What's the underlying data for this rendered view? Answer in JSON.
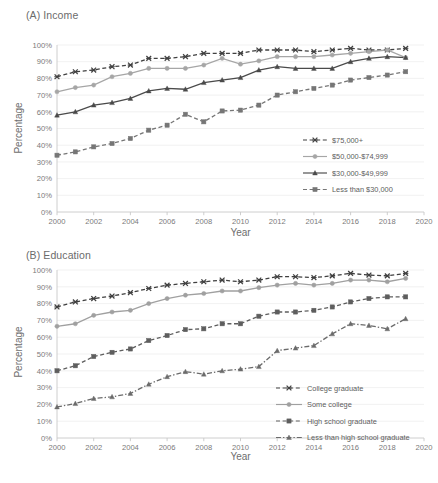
{
  "figure": {
    "panel_a_title": "(A) Income",
    "panel_b_title": "(B) Education",
    "xlabel": "Year",
    "ylabel": "Percentage"
  },
  "axis": {
    "y_ticks": [
      "0%",
      "10%",
      "20%",
      "30%",
      "40%",
      "50%",
      "60%",
      "70%",
      "80%",
      "90%",
      "100%"
    ],
    "x_ticks": [
      "2000",
      "2002",
      "2004",
      "2006",
      "2008",
      "2010",
      "2012",
      "2014",
      "2016",
      "2018",
      "2020"
    ]
  },
  "chart_data": [
    {
      "type": "line",
      "title": "(A) Income",
      "xlabel": "Year",
      "ylabel": "Percentage",
      "grid": true,
      "legend_position": "inside-right-middle",
      "xlim": [
        2000,
        2020
      ],
      "ylim": [
        0,
        100
      ],
      "x": [
        2000,
        2001,
        2002,
        2003,
        2004,
        2005,
        2006,
        2007,
        2008,
        2009,
        2010,
        2011,
        2012,
        2013,
        2014,
        2015,
        2016,
        2017,
        2018,
        2019
      ],
      "series": [
        {
          "name": "$75,000+",
          "marker": "x-marker",
          "linestyle": "dashed",
          "color": "#404040",
          "values": [
            81,
            84,
            85,
            87,
            88,
            92,
            92,
            93,
            95,
            95,
            95,
            97,
            97,
            97,
            96,
            97,
            98,
            97,
            97,
            98
          ]
        },
        {
          "name": "$50,000-$74,999",
          "marker": "circle-marker",
          "linestyle": "solid",
          "color": "#a6a6a6",
          "values": [
            72,
            74.5,
            76,
            81,
            83,
            86,
            86,
            86,
            88,
            92,
            88.5,
            90.5,
            93,
            93,
            93,
            94,
            95,
            96,
            97,
            92.5
          ]
        },
        {
          "name": "$30,000-$49,999",
          "marker": "triangle-marker",
          "linestyle": "solid",
          "color": "#4a4a4a",
          "values": [
            58,
            60,
            64,
            65.5,
            68,
            72.5,
            74,
            73.5,
            77.5,
            79,
            80.5,
            85,
            87,
            86,
            86,
            86,
            90,
            92,
            93,
            92.5
          ]
        },
        {
          "name": "Less than $30,000",
          "marker": "square-marker",
          "linestyle": "dashed",
          "color": "#767676",
          "values": [
            34,
            36,
            39,
            41,
            44,
            49,
            52,
            58.5,
            54,
            60.5,
            61,
            64,
            70,
            72,
            74,
            76,
            79,
            80.5,
            82,
            84
          ]
        }
      ]
    },
    {
      "type": "line",
      "title": "(B) Education",
      "xlabel": "Year",
      "ylabel": "Percentage",
      "grid": true,
      "legend_position": "inside-right-lower",
      "xlim": [
        2000,
        2020
      ],
      "ylim": [
        0,
        100
      ],
      "x": [
        2000,
        2001,
        2002,
        2003,
        2004,
        2005,
        2006,
        2007,
        2008,
        2009,
        2010,
        2011,
        2012,
        2013,
        2014,
        2015,
        2016,
        2017,
        2018,
        2019
      ],
      "series": [
        {
          "name": "College graduate",
          "marker": "x-marker",
          "linestyle": "dashed",
          "color": "#3f3f3f",
          "values": [
            78,
            81,
            83,
            84.5,
            86.5,
            89,
            91,
            92,
            93,
            94,
            93,
            94,
            96,
            96,
            95.5,
            96.5,
            98,
            97,
            96.5,
            98
          ]
        },
        {
          "name": "Some college",
          "marker": "circle-marker",
          "linestyle": "solid",
          "color": "#a0a0a0",
          "values": [
            66.5,
            68,
            73,
            75,
            76,
            80,
            83,
            85,
            86,
            87.5,
            87.5,
            89.5,
            91,
            92,
            91,
            92,
            94,
            94,
            93,
            95
          ]
        },
        {
          "name": "High school graduate",
          "marker": "square-marker",
          "linestyle": "dashed",
          "color": "#5e5e5e",
          "values": [
            40,
            43,
            48.5,
            51,
            53,
            58,
            61,
            64.5,
            65,
            68,
            68,
            72.5,
            75,
            75,
            76,
            78,
            81,
            83,
            84,
            84
          ]
        },
        {
          "name": "Less than high school graduate",
          "marker": "triangle-marker",
          "linestyle": "dash-dot",
          "color": "#6b6b6b",
          "values": [
            18.5,
            20.5,
            23.5,
            24.5,
            26.5,
            32,
            36.5,
            39.5,
            38,
            40,
            41,
            42.5,
            52,
            53.5,
            55,
            62,
            68,
            67,
            65,
            71
          ]
        }
      ]
    }
  ]
}
